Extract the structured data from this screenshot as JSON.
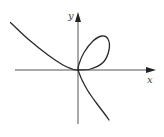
{
  "chart_data": {
    "type": "line",
    "title": "",
    "xlabel": "x",
    "ylabel": "y",
    "grid": false,
    "xlim": [
      -1.4,
      1.6
    ],
    "ylim": [
      -1.1,
      1.2
    ],
    "series": [
      {
        "name": "left-branch",
        "points": [
          [
            -1.35,
            0.95
          ],
          [
            -1.0,
            0.62
          ],
          [
            -0.6,
            0.3
          ],
          [
            -0.3,
            0.1
          ],
          [
            -0.1,
            0.015
          ],
          [
            0,
            0
          ]
        ]
      },
      {
        "name": "loop",
        "points": [
          [
            0,
            0
          ],
          [
            0.25,
            0.02
          ],
          [
            0.5,
            0.15
          ],
          [
            0.62,
            0.4
          ],
          [
            0.6,
            0.62
          ],
          [
            0.48,
            0.68
          ],
          [
            0.3,
            0.58
          ],
          [
            0.12,
            0.35
          ],
          [
            0.02,
            0.12
          ],
          [
            0,
            0
          ]
        ]
      },
      {
        "name": "lower-branch",
        "points": [
          [
            0,
            0
          ],
          [
            0.08,
            -0.2
          ],
          [
            0.2,
            -0.42
          ],
          [
            0.36,
            -0.65
          ],
          [
            0.52,
            -0.86
          ],
          [
            0.62,
            -1.0
          ]
        ]
      }
    ]
  }
}
